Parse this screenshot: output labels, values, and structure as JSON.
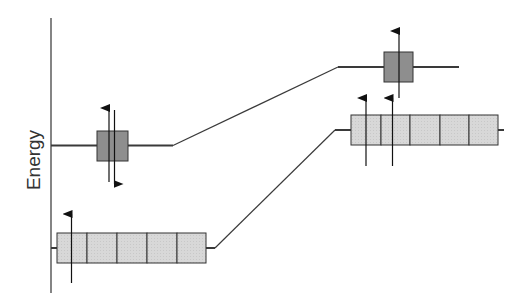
{
  "diagram": {
    "axis": {
      "label": "Energy",
      "color": "#333333"
    },
    "colors": {
      "line": "#3a3a3a",
      "single_orbital_fill": "#8e8e8e",
      "multi_orbital_fill": "#d8d8d8",
      "box_stroke": "#333333",
      "arrow": "#111111"
    },
    "levels": [
      {
        "id": "left-upper",
        "side": "left",
        "orbital_count": 1,
        "electrons": [
          {
            "spin": "up"
          },
          {
            "spin": "down"
          }
        ],
        "description": "single orbital, paired electrons"
      },
      {
        "id": "left-lower",
        "side": "left",
        "orbital_count": 5,
        "electrons": [
          {
            "spin": "up"
          }
        ],
        "description": "five degenerate orbitals, one electron"
      },
      {
        "id": "right-upper",
        "side": "right",
        "orbital_count": 1,
        "electrons": [
          {
            "spin": "up"
          }
        ],
        "description": "single orbital, one electron"
      },
      {
        "id": "right-lower",
        "side": "right",
        "orbital_count": 5,
        "electrons": [
          {
            "spin": "up"
          },
          {
            "spin": "up"
          }
        ],
        "description": "five degenerate orbitals, two electrons"
      }
    ],
    "connectors": [
      {
        "from": "left-upper",
        "to": "right-upper"
      },
      {
        "from": "left-lower",
        "to": "right-lower"
      }
    ]
  }
}
